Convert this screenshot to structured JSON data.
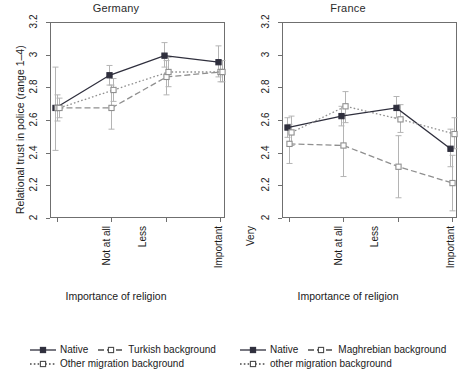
{
  "figure": {
    "width": 464,
    "height": 385,
    "background": "#ffffff"
  },
  "axis": {
    "ylabel": "Relational trust in police (range 1–4)",
    "xlabel": "Importance of religion",
    "yticks": [
      "2",
      "2.2",
      "2.4",
      "2.6",
      "2.8",
      "3",
      "3.2"
    ],
    "ytick_values": [
      2,
      2.2,
      2.4,
      2.6,
      2.8,
      3,
      3.2
    ],
    "ylim": [
      2,
      3.2
    ],
    "xtick_labels": [
      "Not at all",
      "Less",
      "Important",
      "Very"
    ],
    "grid": "off",
    "frame_color": "#6f6f6f",
    "errorbar_color": "#b4b4b4"
  },
  "chart_data": [
    {
      "type": "line",
      "title": "Germany",
      "xlabel": "Importance of religion",
      "ylabel": "Relational trust in police (range 1–4)",
      "categories": [
        "Not at all",
        "Less",
        "Important",
        "Very"
      ],
      "ylim": [
        2,
        3.2
      ],
      "grid": "off",
      "legend_position": "below",
      "series": [
        {
          "name": "Native",
          "style": "solid",
          "marker": "filled-square",
          "color": "#2f2f3d",
          "values": [
            2.68,
            2.88,
            3.0,
            2.96
          ],
          "err_low": [
            2.42,
            2.82,
            2.93,
            2.87
          ],
          "err_high": [
            2.93,
            2.94,
            3.08,
            3.06
          ]
        },
        {
          "name": "Turkish background",
          "style": "dashed",
          "marker": "open-square",
          "color": "#8f8f8f",
          "values": [
            2.68,
            2.68,
            2.87,
            2.9
          ],
          "err_low": [
            2.6,
            2.55,
            2.76,
            2.84
          ],
          "err_high": [
            2.76,
            2.82,
            2.97,
            2.97
          ]
        },
        {
          "name": "Other migration background",
          "style": "dotted",
          "marker": "open-square",
          "color": "#8f8f8f",
          "values": [
            2.68,
            2.79,
            2.9,
            2.9
          ],
          "err_low": [
            2.62,
            2.72,
            2.81,
            2.84
          ],
          "err_high": [
            2.74,
            2.86,
            2.99,
            2.97
          ]
        }
      ]
    },
    {
      "type": "line",
      "title": "France",
      "xlabel": "Importance of religion",
      "ylabel": "Relational trust in police (range 1–4)",
      "categories": [
        "Not at all",
        "Less",
        "Important",
        "Very"
      ],
      "ylim": [
        2,
        3.2
      ],
      "grid": "off",
      "legend_position": "below",
      "series": [
        {
          "name": "Native",
          "style": "solid",
          "marker": "filled-square",
          "color": "#2f2f3d",
          "values": [
            2.56,
            2.63,
            2.68,
            2.43
          ],
          "err_low": [
            2.5,
            2.57,
            2.62,
            2.32
          ],
          "err_high": [
            2.62,
            2.69,
            2.75,
            2.55
          ]
        },
        {
          "name": "Maghrebian background",
          "style": "dashed",
          "marker": "open-square",
          "color": "#8f8f8f",
          "values": [
            2.46,
            2.45,
            2.32,
            2.22
          ],
          "err_low": [
            2.34,
            2.26,
            2.13,
            2.05
          ],
          "err_high": [
            2.58,
            2.64,
            2.51,
            2.39
          ]
        },
        {
          "name": "other migration background",
          "style": "dotted",
          "marker": "open-square",
          "color": "#8f8f8f",
          "values": [
            2.53,
            2.69,
            2.61,
            2.52
          ],
          "err_low": [
            2.45,
            2.59,
            2.53,
            2.43
          ],
          "err_high": [
            2.63,
            2.78,
            2.7,
            2.62
          ]
        }
      ]
    }
  ],
  "legends": {
    "left": {
      "entries": [
        {
          "label": "Native",
          "style": "solid",
          "marker": "filled-square"
        },
        {
          "label": "Turkish background",
          "style": "dashed",
          "marker": "open-square"
        },
        {
          "label": "Other migration background",
          "style": "dotted",
          "marker": "open-square"
        }
      ]
    },
    "right": {
      "entries": [
        {
          "label": "Native",
          "style": "solid",
          "marker": "filled-square"
        },
        {
          "label": "Maghrebian background",
          "style": "dashed",
          "marker": "open-square"
        },
        {
          "label": "other migration background",
          "style": "dotted",
          "marker": "open-square"
        }
      ]
    }
  }
}
